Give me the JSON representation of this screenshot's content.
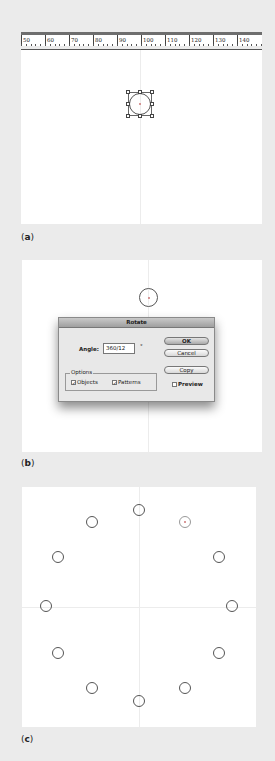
{
  "panels": {
    "a": {
      "label": "a",
      "ruler": {
        "ticks": [
          "50",
          "60",
          "70",
          "80",
          "90",
          "100",
          "110",
          "120",
          "130",
          "140"
        ]
      }
    },
    "b": {
      "label": "b",
      "dialog": {
        "title": "Rotate",
        "angle_label": "Angle:",
        "angle_value": "360/12",
        "degree_symbol": "°",
        "options_legend": "Options",
        "objects_label": "Objects",
        "objects_checked": "✓",
        "patterns_label": "Patterns",
        "patterns_checked": "✓",
        "ok_label": "OK",
        "cancel_label": "Cancel",
        "copy_label": "Copy",
        "preview_label": "Preview",
        "preview_checked": ""
      }
    },
    "c": {
      "label": "c",
      "circle_count": 12
    }
  }
}
